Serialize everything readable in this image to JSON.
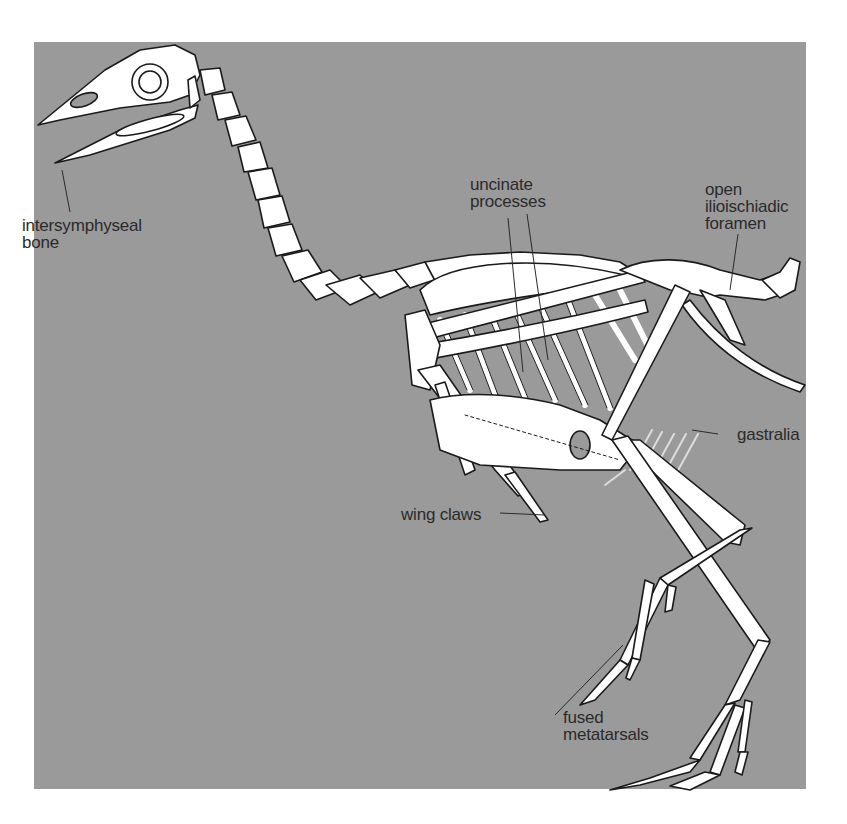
{
  "figure": {
    "background_color": "#9a9a9a",
    "bone_color": "#ffffff",
    "outline_color": "#1a1a1a",
    "label_color": "#2a2a2a"
  },
  "labels": [
    {
      "id": "intersymphyseal",
      "lines": [
        "intersymphyseal",
        "bone"
      ]
    },
    {
      "id": "uncinate",
      "lines": [
        "uncinate",
        "processes"
      ]
    },
    {
      "id": "foramen",
      "lines": [
        "open",
        "ilioischiadic",
        "foramen"
      ]
    },
    {
      "id": "gastralia",
      "lines": [
        "gastralia"
      ]
    },
    {
      "id": "wing_claws",
      "lines": [
        "wing claws"
      ]
    },
    {
      "id": "metatarsals",
      "lines": [
        "fused",
        "metatarsals"
      ]
    }
  ]
}
